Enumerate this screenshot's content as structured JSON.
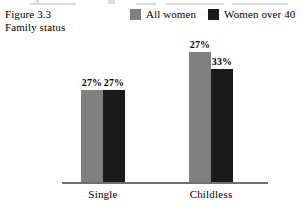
{
  "figure": {
    "caption_lines": [
      "Figure 3.3",
      "Family status"
    ]
  },
  "legend": {
    "items": [
      {
        "label": "All women",
        "color": "#808080",
        "swatch_name": "legend-swatch-all-women"
      },
      {
        "label": "Women over 40",
        "color": "#1a1a1a",
        "swatch_name": "legend-swatch-women-over-40"
      }
    ]
  },
  "chart_data": {
    "type": "bar",
    "title": "Family status",
    "subtitle": "Figure 3.3",
    "categories": [
      "Single",
      "Childless"
    ],
    "series": [
      {
        "name": "All women",
        "color": "#808080",
        "values": [
          27,
          38
        ],
        "labels": [
          "27%",
          "27%"
        ]
      },
      {
        "name": "Women over 40",
        "color": "#1a1a1a",
        "values": [
          27,
          33
        ],
        "labels": [
          "27%",
          "33%"
        ]
      }
    ],
    "value_labels": {
      "Single": {
        "All women": "27%",
        "Women over 40": "27%"
      },
      "Childless": {
        "All women": "38%",
        "Women over 40": "33%"
      }
    },
    "xlabel": "",
    "ylabel": "",
    "ylim": [
      0,
      40
    ],
    "unit": "%",
    "grid": false,
    "axis_visible": "x-only",
    "legend_position": "top-right"
  }
}
